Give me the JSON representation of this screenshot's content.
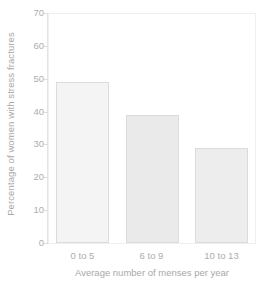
{
  "chart_data": {
    "type": "bar",
    "title": "",
    "subtitle": "",
    "xlabel": "Average number of menses per year",
    "ylabel": "Percentage of women with stress fractures",
    "categories": [
      "0 to 5",
      "6 to 9",
      "10 to 13"
    ],
    "values": [
      49,
      39,
      29
    ],
    "series": [
      {
        "name": "Percentage of women with stress fractures",
        "values": [
          49,
          39,
          29
        ]
      }
    ],
    "ylim": [
      0,
      70
    ],
    "yticks": [
      0,
      10,
      20,
      30,
      40,
      50,
      60,
      70
    ],
    "ytick_labels": [
      "0",
      "10",
      "20",
      "30",
      "40",
      "50",
      "60",
      "70"
    ],
    "grid": false,
    "legend": false,
    "legend_position": "none",
    "annotations": [],
    "colors": {
      "bar_fill_1": "#f4f4f4",
      "bar_fill_2": "#eaeaea",
      "bar_fill_3": "#ededed",
      "bar_border": "#dbdbdb",
      "axis": "#e4e4e4",
      "frame": "#efefef",
      "text": "#acacac",
      "background": "#ffffff"
    }
  }
}
